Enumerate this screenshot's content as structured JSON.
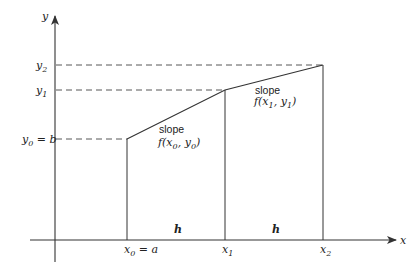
{
  "axes": {
    "x_label": "x",
    "y_label": "y"
  },
  "x_ticks": [
    {
      "main": "x",
      "sub": "0",
      "suffix": " = a",
      "x": 127
    },
    {
      "main": "x",
      "sub": "1",
      "suffix": "",
      "x": 225
    },
    {
      "main": "x",
      "sub": "2",
      "suffix": "",
      "x": 323
    }
  ],
  "y_ticks": [
    {
      "main": "y",
      "sub": "2",
      "suffix": "",
      "y": 65
    },
    {
      "main": "y",
      "sub": "1",
      "suffix": "",
      "y": 90
    },
    {
      "main": "y",
      "sub": "0",
      "suffix": " = b",
      "y": 139
    }
  ],
  "intervals": [
    {
      "label": "h"
    },
    {
      "label": "h"
    }
  ],
  "slopes": [
    {
      "word": "slope",
      "func": "f(x",
      "sub_x": "0",
      "mid": ", y",
      "sub_y": "0",
      "close": ")"
    },
    {
      "word": "slope",
      "func": "f(x",
      "sub_x": "1",
      "mid": ", y",
      "sub_y": "1",
      "close": ")"
    }
  ],
  "colors": {
    "line": "#333333",
    "dash": "#444444",
    "text": "#222222"
  }
}
